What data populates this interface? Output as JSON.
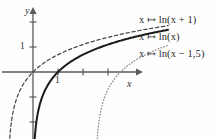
{
  "figure": {
    "title": "",
    "axes": {
      "x_axis_label": "x",
      "y_axis_label": "y",
      "x_tick_label": "1",
      "y_tick_label": "1"
    },
    "legend": {
      "items": [
        {
          "text": "x ↦ ln(x + 1)",
          "style": "dashed"
        },
        {
          "text": "x ↦ ln(x)",
          "style": "solid"
        },
        {
          "text": "x ↦ ln(x − 1,5)",
          "style": "dotted"
        }
      ]
    },
    "colors": {
      "axis": "#5a5a5a",
      "curve_solid": "#1a1a1a",
      "curve_dashed": "#4a4a4a",
      "curve_dotted": "#8a8a8a",
      "text": "#2a2a2a",
      "background": "#fefefe"
    }
  },
  "chart_data": {
    "type": "line",
    "title": "",
    "xlabel": "x",
    "ylabel": "y",
    "xlim": [
      -1.35,
      4.2
    ],
    "ylim": [
      -2.6,
      2.5
    ],
    "grid": false,
    "legend_position": "right",
    "x_ticks": [
      1,
      2,
      3
    ],
    "y_ticks": [
      -2,
      -1,
      1,
      2
    ],
    "x_tick_labels_shown": [
      "1"
    ],
    "y_tick_labels_shown": [
      "1"
    ],
    "origin_px": [
      33,
      72
    ],
    "unit_px": 25,
    "series": [
      {
        "name": "x ↦ ln(x + 1)",
        "style": "dashed",
        "asymptote_x": -1,
        "x_intercept": 0,
        "x": [
          -0.97,
          -0.9,
          -0.8,
          -0.6,
          -0.4,
          -0.2,
          0,
          0.25,
          0.5,
          1,
          1.5,
          2,
          2.5,
          3,
          3.5,
          4,
          4.2
        ],
        "y": [
          -3.51,
          -2.3,
          -1.61,
          -0.92,
          -0.51,
          -0.22,
          0,
          0.22,
          0.41,
          0.69,
          0.92,
          1.1,
          1.25,
          1.39,
          1.5,
          1.61,
          1.65
        ]
      },
      {
        "name": "x ↦ ln(x)",
        "style": "solid",
        "asymptote_x": 0,
        "x_intercept": 1,
        "x": [
          0.04,
          0.08,
          0.15,
          0.25,
          0.4,
          0.6,
          0.8,
          1,
          1.5,
          2,
          2.5,
          3,
          3.5,
          4,
          4.2
        ],
        "y": [
          -3.22,
          -2.53,
          -1.9,
          -1.39,
          -0.92,
          -0.51,
          -0.22,
          0,
          0.41,
          0.69,
          0.92,
          1.1,
          1.25,
          1.39,
          1.44
        ]
      },
      {
        "name": "x ↦ ln(x − 1,5)",
        "style": "dotted",
        "asymptote_x": 2.5,
        "x_intercept": 2.5,
        "x": [
          1.54,
          1.58,
          1.65,
          1.75,
          1.9,
          2.1,
          2.3,
          2.5,
          3,
          3.5,
          4,
          4.2
        ],
        "y": [
          -3.22,
          -2.53,
          -1.9,
          -1.39,
          -0.92,
          -0.51,
          -0.22,
          0,
          0.41,
          0.69,
          0.92,
          1.0
        ]
      }
    ]
  }
}
